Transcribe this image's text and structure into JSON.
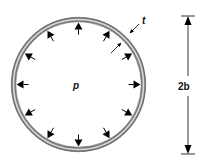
{
  "diagram": {
    "labels": {
      "pressure": "p",
      "thickness": "t",
      "diameter_dimension": "2b"
    },
    "ring": {
      "center_x": 78.5,
      "center_y": 84.5,
      "outer_radius": 67,
      "thickness_px": 4,
      "stroke_color": "#8a8a8a",
      "highlight_color": "#d8d8d8"
    },
    "pressure_arrows": {
      "count": 12,
      "direction": "outward-normal, pointing toward wall",
      "angles_deg": [
        0,
        30,
        60,
        90,
        120,
        150,
        180,
        210,
        240,
        270,
        300,
        330
      ],
      "color": "#000000"
    },
    "dimension": {
      "x": 188,
      "y_top": 16,
      "y_bottom": 154,
      "label": "2b"
    }
  }
}
